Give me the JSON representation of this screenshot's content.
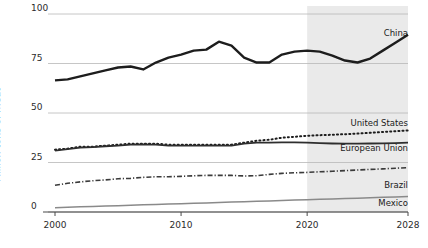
{
  "chart_data": {
    "type": "line",
    "title": "",
    "xlabel": "",
    "ylabel": "Million tons of meat",
    "xlim": [
      2000,
      2028
    ],
    "ylim": [
      0,
      100
    ],
    "grid": true,
    "legend_position": "right-inline",
    "x_ticks": [
      "2000",
      "2010",
      "2020",
      "2028"
    ],
    "x_tick_values": [
      2000,
      2010,
      2020,
      2028
    ],
    "y_ticks": [
      "0",
      "25",
      "50",
      "75",
      "100"
    ],
    "y_tick_values": [
      0,
      25,
      50,
      75,
      100
    ],
    "projection_start_year": 2020,
    "projection_shading": "#eaeaea",
    "x": [
      2000,
      2001,
      2002,
      2003,
      2004,
      2005,
      2006,
      2007,
      2008,
      2009,
      2010,
      2011,
      2012,
      2013,
      2014,
      2015,
      2016,
      2017,
      2018,
      2019,
      2020,
      2021,
      2022,
      2023,
      2024,
      2025,
      2026,
      2027,
      2028
    ],
    "series": [
      {
        "name": "China",
        "color": "#1d1d1d",
        "style": "solid",
        "width": 2.4,
        "label_x": 2025.4,
        "label_y": 90,
        "values": [
          66.5,
          67.0,
          68.5,
          70.0,
          71.5,
          73.0,
          73.5,
          72.0,
          75.5,
          78.0,
          79.5,
          81.5,
          82.0,
          86.0,
          84.0,
          78.0,
          75.5,
          75.5,
          79.5,
          81.0,
          81.5,
          81.0,
          79.0,
          76.5,
          75.5,
          77.5,
          81.5,
          85.5,
          89.5
        ]
      },
      {
        "name": "United States",
        "color": "#1d1d1d",
        "style": "dotted",
        "width": 2.0,
        "label_x": 2026.0,
        "label_y": 44.5,
        "values": [
          31.5,
          32.0,
          33.0,
          33.0,
          33.5,
          34.0,
          34.5,
          34.5,
          34.5,
          34.0,
          34.0,
          34.0,
          34.0,
          34.0,
          34.0,
          35.0,
          36.0,
          36.5,
          37.5,
          38.0,
          38.5,
          38.8,
          39.0,
          39.3,
          39.6,
          40.0,
          40.4,
          40.8,
          41.2
        ]
      },
      {
        "name": "European Union",
        "color": "#2e2e2e",
        "style": "solid",
        "width": 1.8,
        "label_x": 2026.0,
        "label_y": 32.0,
        "values": [
          31.0,
          31.8,
          32.5,
          32.8,
          33.2,
          33.5,
          34.0,
          34.2,
          34.0,
          33.5,
          33.5,
          33.5,
          33.5,
          33.5,
          33.5,
          34.5,
          35.0,
          35.0,
          35.2,
          35.2,
          35.0,
          34.8,
          34.6,
          34.5,
          34.5,
          34.6,
          34.7,
          34.8,
          35.0
        ]
      },
      {
        "name": "Brazil",
        "color": "#3a3a3a",
        "style": "dashdot",
        "width": 1.6,
        "label_x": 2026.0,
        "label_y": 13.0,
        "values": [
          13.5,
          14.5,
          15.2,
          15.8,
          16.2,
          16.8,
          17.0,
          17.5,
          17.8,
          17.8,
          18.0,
          18.3,
          18.5,
          18.5,
          18.5,
          18.2,
          18.3,
          19.0,
          19.5,
          19.8,
          20.0,
          20.3,
          20.6,
          20.9,
          21.2,
          21.5,
          21.8,
          22.1,
          22.4
        ]
      },
      {
        "name": "Mexico",
        "color": "#8a8a8a",
        "style": "solid",
        "width": 1.5,
        "label_x": 2026.0,
        "label_y": 4.0,
        "values": [
          2.2,
          2.4,
          2.6,
          2.8,
          3.0,
          3.2,
          3.4,
          3.6,
          3.8,
          4.0,
          4.2,
          4.4,
          4.6,
          4.8,
          5.0,
          5.2,
          5.4,
          5.6,
          5.8,
          6.0,
          6.2,
          6.4,
          6.6,
          6.8,
          7.0,
          7.2,
          7.4,
          7.6,
          7.8
        ]
      }
    ]
  }
}
